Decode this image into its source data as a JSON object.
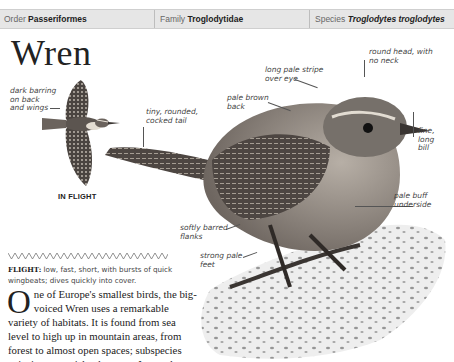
{
  "header": {
    "order": {
      "label": "Order",
      "value": "Passeriformes"
    },
    "family": {
      "label": "Family",
      "value": "Troglodytidae"
    },
    "species": {
      "label": "Species",
      "value": "Troglodytes troglodytes"
    }
  },
  "title": "Wren",
  "flight_illustration": {
    "caption": "IN FLIGHT",
    "annotations": [
      {
        "lines": [
          "dark barring",
          "on back",
          "and wings"
        ]
      }
    ]
  },
  "main_illustration": {
    "annotations": [
      {
        "id": "tail",
        "lines": [
          "tiny, rounded,",
          "cocked tail"
        ]
      },
      {
        "id": "back",
        "lines": [
          "pale brown",
          "back"
        ]
      },
      {
        "id": "stripe",
        "lines": [
          "long pale stripe",
          "over eye"
        ]
      },
      {
        "id": "head",
        "lines": [
          "round head, with",
          "no neck"
        ]
      },
      {
        "id": "bill",
        "lines": [
          "fine,",
          "long",
          "bill"
        ]
      },
      {
        "id": "underside",
        "lines": [
          "pale buff",
          "underside"
        ]
      },
      {
        "id": "flanks",
        "lines": [
          "softly barred",
          "flanks"
        ]
      },
      {
        "id": "feet",
        "lines": [
          "strong pale",
          "feet"
        ]
      }
    ]
  },
  "flight": {
    "label": "FLIGHT:",
    "text_line1": " low, fast, short, with bursts of quick",
    "text_line2": "wingbeats; dives quickly into cover."
  },
  "body": {
    "dropcap": "O",
    "lines": [
      "ne of Europe's smallest birds, the big-",
      "voiced Wren uses a remarkable",
      "variety of habitats. It is found from sea",
      "level to high up in mountain areas, from",
      "forest to almost open spaces; subspecies",
      "exist in remote island groups. It spends most"
    ]
  },
  "colors": {
    "header_bg": "#e6e6e6",
    "text": "#222222",
    "label_text": "#444444",
    "bird_dark": "#3a3532",
    "bird_mid": "#6e6660",
    "bird_light": "#b9b2aa",
    "rock": "#d8d8d8"
  }
}
